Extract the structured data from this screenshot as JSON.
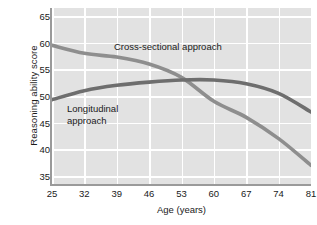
{
  "chart_data": {
    "type": "line",
    "title": "",
    "xlabel": "Age (years)",
    "ylabel": "Reasoning ability score",
    "xlim": [
      25,
      81
    ],
    "ylim": [
      33.5,
      66.5
    ],
    "xticks": [
      25,
      32,
      39,
      46,
      53,
      60,
      67,
      74,
      81
    ],
    "xtick_labels": [
      "25",
      "32",
      "39",
      "46",
      "53",
      "60",
      "67",
      "74",
      "81"
    ],
    "yticks": [
      35,
      40,
      45,
      50,
      55,
      60,
      65
    ],
    "ytick_labels": [
      "35",
      "40",
      "45",
      "50",
      "55",
      "60",
      "65"
    ],
    "grid": true,
    "grid_color": "#ffffff",
    "plot_background": "#e2e2e2",
    "legend": "annotations-inline",
    "x": [
      25,
      32,
      39,
      46,
      53,
      60,
      67,
      74,
      81
    ],
    "series": [
      {
        "name": "Cross-sectional approach",
        "color": "#8e8e8e",
        "values": [
          59.5,
          58.0,
          57.3,
          56.0,
          53.5,
          49.0,
          46.0,
          42.0,
          37.0
        ]
      },
      {
        "name": "Longitudinal approach",
        "color": "#6e6e6e",
        "values": [
          49.3,
          51.0,
          52.0,
          52.6,
          53.0,
          53.0,
          52.3,
          50.5,
          47.0
        ]
      }
    ],
    "annotations": [
      {
        "text": "Cross-sectional approach",
        "x": 38.5,
        "y": 57.8
      },
      {
        "text": "Longitudinal\napproach",
        "x": 28.5,
        "y": 46.5
      }
    ]
  }
}
